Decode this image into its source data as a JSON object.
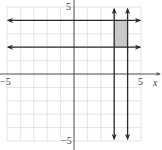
{
  "chart_data": {
    "type": "line",
    "title": "",
    "xlabel": "x",
    "ylabel": "",
    "xlim": [
      -5,
      5
    ],
    "ylim": [
      -5,
      5
    ],
    "grid": true,
    "grid_step": 1,
    "tick_labels": {
      "x": [
        {
          "value": -5,
          "label": "−5"
        },
        {
          "value": 5,
          "label": "5"
        }
      ],
      "y": [
        {
          "value": 5,
          "label": "5"
        },
        {
          "value": -5,
          "label": "−5"
        }
      ]
    },
    "series": [
      {
        "name": "y = 4",
        "kind": "horizontal-line",
        "value": 4,
        "arrows": "both"
      },
      {
        "name": "y = 2",
        "kind": "horizontal-line",
        "value": 2,
        "arrows": "both"
      },
      {
        "name": "x = 3",
        "kind": "vertical-line",
        "value": 3,
        "arrows": "both"
      },
      {
        "name": "x = 4",
        "kind": "vertical-line",
        "value": 4,
        "arrows": "both"
      }
    ],
    "shaded_region": {
      "x": [
        3,
        4
      ],
      "y": [
        2,
        4
      ],
      "color": "#c8c8c8"
    },
    "colors": {
      "grid": "#dcdcdc",
      "axis": "#555555",
      "line": "#2a2a2a",
      "shade": "#c8c8c8"
    }
  },
  "labels": {
    "x_axis_name": "x",
    "x_min": "−5",
    "x_max": "5",
    "y_max": "5",
    "y_min": "−5"
  }
}
